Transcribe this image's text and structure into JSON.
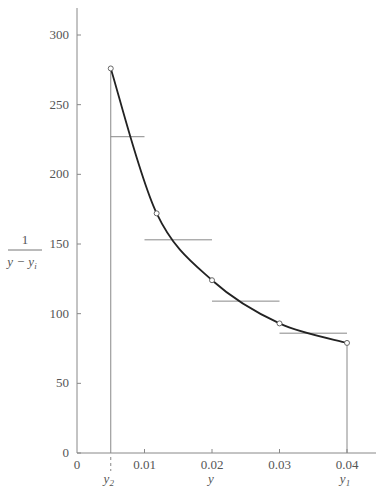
{
  "chart_data": {
    "type": "line",
    "title": "",
    "xlabel": "y",
    "ylabel": "1 / (y − y_i)",
    "ylabel_numerator": "1",
    "ylabel_denominator": "y − y",
    "ylabel_denominator_sub": "i",
    "xlim": [
      0,
      0.045
    ],
    "ylim": [
      0,
      320
    ],
    "x_ticks": [
      0,
      0.01,
      0.02,
      0.03,
      0.04
    ],
    "x_tick_labels": [
      "0",
      "0.01",
      "0.02",
      "0.03",
      "0.04"
    ],
    "y_ticks": [
      0,
      50,
      100,
      150,
      200,
      250,
      300
    ],
    "y_tick_labels": [
      "0",
      "50",
      "100",
      "150",
      "200",
      "250",
      "300"
    ],
    "grid": false,
    "annotations": [
      {
        "x": 0.005,
        "label": "y",
        "sub": "2"
      },
      {
        "x": 0.04,
        "label": "y",
        "sub": "1"
      }
    ],
    "series": [
      {
        "name": "curve",
        "style": "smooth line with circle markers",
        "x": [
          0.005,
          0.0118,
          0.02,
          0.03,
          0.04
        ],
        "y": [
          276,
          172,
          124,
          93,
          79
        ]
      },
      {
        "name": "step-averages",
        "style": "horizontal segments",
        "segments": [
          {
            "x0": 0.005,
            "x1": 0.01,
            "y": 227
          },
          {
            "x0": 0.01,
            "x1": 0.02,
            "y": 153
          },
          {
            "x0": 0.02,
            "x1": 0.03,
            "y": 109
          },
          {
            "x0": 0.03,
            "x1": 0.04,
            "y": 86
          }
        ]
      }
    ],
    "vertical_bounds": [
      {
        "x": 0.005,
        "y_top": 276
      },
      {
        "x": 0.04,
        "y_top": 79
      }
    ]
  },
  "colors": {
    "axis": "#888888",
    "curve": "#222222",
    "steps": "#888888",
    "marker": "#666666",
    "text": "#555555"
  }
}
